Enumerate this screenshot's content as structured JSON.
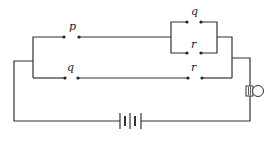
{
  "diagram": {
    "type": "circuit",
    "colors": {
      "wire": "#333333",
      "background": "#ffffff"
    },
    "labels": {
      "top_switch": "p",
      "parallel_top_switch": "q",
      "parallel_bottom_switch": "r",
      "lower_left_switch": "q",
      "lower_right_switch": "r"
    },
    "components": [
      {
        "id": "switch-p",
        "kind": "switch",
        "label": "p",
        "branch": "upper"
      },
      {
        "id": "switch-q-parallel",
        "kind": "switch",
        "label": "q",
        "branch": "upper-parallel-top"
      },
      {
        "id": "switch-r-parallel",
        "kind": "switch",
        "label": "r",
        "branch": "upper-parallel-bottom"
      },
      {
        "id": "switch-q-lower",
        "kind": "switch",
        "label": "q",
        "branch": "lower"
      },
      {
        "id": "switch-r-lower",
        "kind": "switch",
        "label": "r",
        "branch": "lower"
      },
      {
        "id": "battery",
        "kind": "battery"
      },
      {
        "id": "bulb",
        "kind": "lamp"
      }
    ]
  }
}
